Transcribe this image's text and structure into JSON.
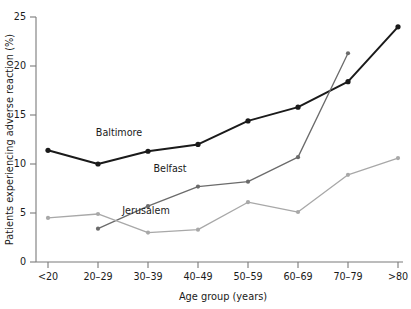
{
  "chart_data": {
    "type": "line",
    "title": "",
    "xlabel": "Age group (years)",
    "ylabel": "Patients experiencing adverse reaction (%)",
    "categories": [
      "<20",
      "20–29",
      "30–39",
      "40–49",
      "50–59",
      "60–69",
      "70–79",
      ">80"
    ],
    "ylim": [
      0,
      25
    ],
    "yticks": [
      0,
      5,
      10,
      15,
      20,
      25
    ],
    "yticklabels": [
      "0",
      "5",
      "10",
      "15",
      "20",
      "25"
    ],
    "grid": false,
    "legend_position": "inline-labels",
    "series": [
      {
        "name": "Baltimore",
        "color": "#1a1a1a",
        "x": [
          "<20",
          "20–29",
          "30–39",
          "40–49",
          "50–59",
          "60–69",
          "70–79",
          ">80"
        ],
        "values": [
          11.4,
          10.0,
          11.3,
          12.0,
          14.4,
          15.8,
          18.4,
          24.0
        ]
      },
      {
        "name": "Belfast",
        "color": "#6b6b6b",
        "x": [
          "20–29",
          "30–39",
          "40–49",
          "50–59",
          "60–69",
          "70–79"
        ],
        "values": [
          3.4,
          5.7,
          7.7,
          8.2,
          10.7,
          21.3
        ]
      },
      {
        "name": "Jerusalem",
        "color": "#a8a8a8",
        "x": [
          "<20",
          "20–29",
          "30–39",
          "40–49",
          "50–59",
          "60–69",
          "70–79",
          ">80"
        ],
        "values": [
          4.5,
          4.9,
          3.0,
          3.3,
          6.1,
          5.1,
          8.9,
          10.6
        ]
      }
    ],
    "annotations": [
      {
        "text": "Baltimore",
        "x": 119,
        "y": 136
      },
      {
        "text": "Belfast",
        "x": 170,
        "y": 172
      },
      {
        "text": "Jerusalem",
        "x": 146,
        "y": 214
      }
    ]
  }
}
